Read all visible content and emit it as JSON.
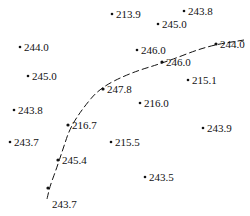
{
  "diagram": {
    "type": "scatter-map-with-boundary-curve",
    "curve": {
      "style": "dashed",
      "color": "#111111",
      "path_points": [
        [
          47,
          199
        ],
        [
          50,
          186
        ],
        [
          56,
          170
        ],
        [
          63,
          149
        ],
        [
          70,
          128
        ],
        [
          83,
          108
        ],
        [
          100,
          88
        ],
        [
          130,
          73
        ],
        [
          166,
          62
        ],
        [
          207,
          46
        ],
        [
          244,
          40
        ]
      ],
      "marked_points": [
        {
          "label": "244.0",
          "x": 216,
          "y": 44
        },
        {
          "label": "246.0",
          "x": 162,
          "y": 62
        },
        {
          "label": "247.8",
          "x": 103,
          "y": 89
        },
        {
          "label": "216.7",
          "x": 68,
          "y": 125
        },
        {
          "label": "245.4",
          "x": 58,
          "y": 160
        },
        {
          "label": "243.7",
          "x": 48,
          "y": 188
        }
      ]
    },
    "points": [
      {
        "label": "213.9",
        "x": 112,
        "y": 14
      },
      {
        "label": "243.8",
        "x": 184,
        "y": 11
      },
      {
        "label": "245.0",
        "x": 158,
        "y": 24
      },
      {
        "label": "244.0",
        "x": 20,
        "y": 47
      },
      {
        "label": "246.0",
        "x": 137,
        "y": 50
      },
      {
        "label": "245.0",
        "x": 28,
        "y": 76
      },
      {
        "label": "215.1",
        "x": 188,
        "y": 80
      },
      {
        "label": "216.0",
        "x": 140,
        "y": 103
      },
      {
        "label": "243.8",
        "x": 14,
        "y": 110
      },
      {
        "label": "243.9",
        "x": 203,
        "y": 128
      },
      {
        "label": "243.7",
        "x": 10,
        "y": 142
      },
      {
        "label": "215.5",
        "x": 111,
        "y": 142
      },
      {
        "label": "243.5",
        "x": 145,
        "y": 177
      }
    ]
  }
}
